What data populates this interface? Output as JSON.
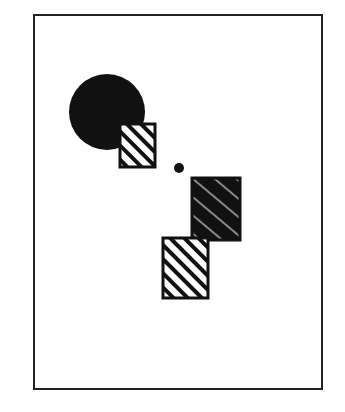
{
  "diagram": {
    "frame": {
      "x": 33,
      "y": 14,
      "width": 290,
      "height": 376
    },
    "colors": {
      "ink": "#111111",
      "paper": "#ffffff"
    },
    "shapes": [
      {
        "type": "circle",
        "fill": "solid-black",
        "cx": 107,
        "cy": 112,
        "r": 38
      },
      {
        "type": "square",
        "fill": "hatched",
        "x": 120,
        "y": 124,
        "w": 35,
        "h": 43
      },
      {
        "type": "dot",
        "fill": "solid-black",
        "cx": 179,
        "cy": 169,
        "r": 5
      },
      {
        "type": "square",
        "fill": "solid-black-with-light-hatch",
        "x": 192,
        "y": 178,
        "w": 48,
        "h": 62
      },
      {
        "type": "square",
        "fill": "hatched",
        "x": 163,
        "y": 238,
        "w": 45,
        "h": 60
      }
    ]
  }
}
